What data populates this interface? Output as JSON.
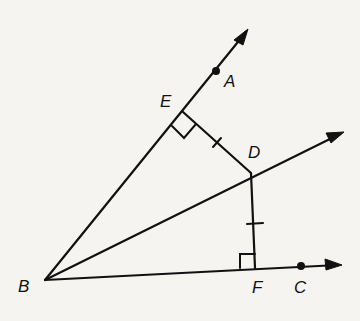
{
  "diagram": {
    "type": "geometry",
    "colors": {
      "ink": "#111111",
      "paper": "#f5f4f1"
    },
    "points": {
      "A": {
        "label": "A"
      },
      "B": {
        "label": "B"
      },
      "C": {
        "label": "C"
      },
      "D": {
        "label": "D"
      },
      "E": {
        "label": "E"
      },
      "F": {
        "label": "F"
      }
    },
    "rays": [
      "BA",
      "BD",
      "BC"
    ],
    "segments": [
      "DE",
      "DF"
    ],
    "marks": {
      "right_angles": [
        "E",
        "F"
      ],
      "congruent_ticks": [
        "DE",
        "DF"
      ]
    }
  }
}
